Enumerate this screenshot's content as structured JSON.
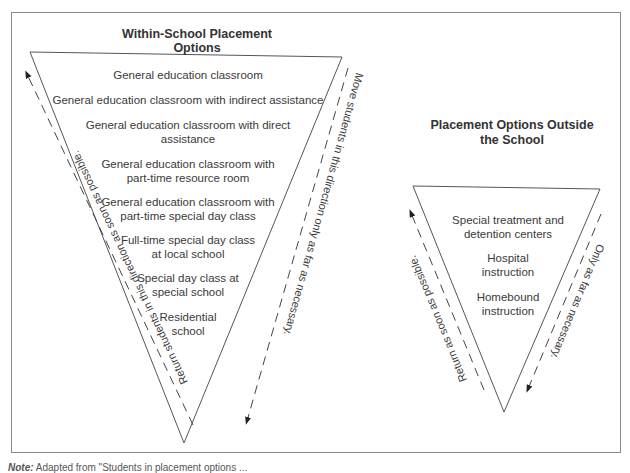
{
  "left_panel": {
    "title": "Within-School Placement Options",
    "items": [
      {
        "label": "General education classroom"
      },
      {
        "label": "General education classroom with indirect assistance"
      },
      {
        "label": "General education classroom with direct",
        "label2": "assistance"
      },
      {
        "label": "General education classroom with",
        "label2": "part-time resource room"
      },
      {
        "label": "General education classroom with",
        "label2": "part-time special day class"
      },
      {
        "label": "Full-time special day class",
        "label2": "at local school"
      },
      {
        "label": "Special day class at",
        "label2": "special school"
      },
      {
        "label": "Residential",
        "label2": "school"
      }
    ],
    "left_arrow_text": "Return students in this direction as soon as possible.",
    "right_arrow_text": "Move students in this direction only as far as necessary."
  },
  "right_panel": {
    "title_line1": "Placement Options Outside",
    "title_line2": "the School",
    "items": [
      {
        "label": "Special treatment and",
        "label2": "detention centers"
      },
      {
        "label": "Hospital",
        "label2": "instruction"
      },
      {
        "label": "Homebound",
        "label2": "instruction"
      }
    ],
    "left_arrow_text": "Return as soon as possible.",
    "right_arrow_text": "Only as far as necessary."
  },
  "note": {
    "prefix": "Note:",
    "text": "Adapted from \"Students in placement options ..."
  },
  "colors": {
    "line": "#555555",
    "frame": "#8a8a8a",
    "text": "#3a3a3a"
  }
}
